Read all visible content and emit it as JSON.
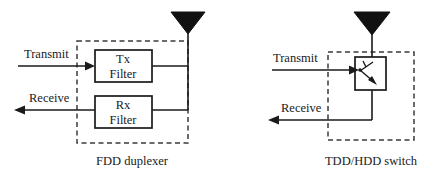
{
  "figure": {
    "background_color": "#ffffff",
    "line_color": "#1a1a1a",
    "dashed_color": "#3b3b3b",
    "antenna_fill": "#111111"
  },
  "left_diagram": {
    "caption": "FDD duplexer",
    "ports": {
      "transmit": "Transmit",
      "receive": "Receive"
    },
    "blocks": [
      {
        "line1": "Tx",
        "line2": "Filter"
      },
      {
        "line1": "Rx",
        "line2": "Filter"
      }
    ],
    "antenna_icon": "antenna-triangle-icon"
  },
  "right_diagram": {
    "caption": "TDD/HDD switch",
    "ports": {
      "transmit": "Transmit",
      "receive": "Receive"
    },
    "switch_icon": "spdt-switch-icon",
    "antenna_icon": "antenna-triangle-icon"
  }
}
